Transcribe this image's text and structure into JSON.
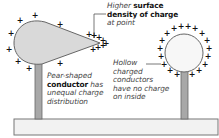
{
  "diagram": {
    "title_annotation": {
      "line1_prefix": "Higher ",
      "line1_bold": "surface",
      "line2_bold": "density of charge",
      "line3": "at point"
    },
    "pear_label": {
      "line1": "Pear-shaped",
      "line2_bold": "conductor",
      "line2_suffix": " has",
      "line3": "unequal charge",
      "line4": "distribution"
    },
    "hollow_label": {
      "line1": "Hollow",
      "line2": "charged",
      "line3": "conductors",
      "line4": "have no charge",
      "line5": "on inside"
    },
    "charge_symbol": "+",
    "colors": {
      "conductor_fill": "#d9d9d9",
      "sphere_fill": "#f7f7f7",
      "outline": "#666666",
      "stand_fill": "#a8a8a8",
      "base_fill": "#f2f2f2",
      "charge": "#111111"
    }
  }
}
